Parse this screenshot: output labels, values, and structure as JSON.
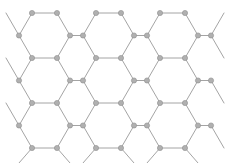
{
  "figure": {
    "background_color": "#ffffff",
    "node_color": "#b0b0b0",
    "node_stroke_color": "#8e8e8e",
    "bond_color": "#9a9a9a",
    "node_radius": 2.6,
    "bond_width": 0.9,
    "width": 239,
    "height": 163
  },
  "chart_data": {
    "type": "scatter",
    "title": "",
    "xlabel": "",
    "ylabel": "",
    "grid": false,
    "legend": null,
    "xlim": [
      0,
      239
    ],
    "ylim": [
      0,
      163
    ],
    "lattice": {
      "kind": "honeycomb",
      "rows": 4,
      "cols": 6,
      "hex_circumradius": 25.7,
      "hex_apothem": 22.3,
      "origin_x": 19.0,
      "origin_y": 13.0,
      "column_step_x": 38.6,
      "row_step_y": 44.6,
      "sublattice_offset_y": 22.3
    },
    "nodes": [
      [
        32.0,
        13.0
      ],
      [
        57.0,
        13.0
      ],
      [
        96.0,
        13.0
      ],
      [
        121.0,
        13.0
      ],
      [
        160.0,
        13.0
      ],
      [
        185.0,
        13.0
      ],
      [
        19.0,
        35.5
      ],
      [
        70.0,
        35.5
      ],
      [
        83.0,
        35.5
      ],
      [
        134.0,
        35.5
      ],
      [
        147.0,
        35.5
      ],
      [
        198.0,
        35.5
      ],
      [
        211.0,
        35.5
      ],
      [
        32.0,
        58.0
      ],
      [
        57.0,
        58.0
      ],
      [
        96.0,
        58.0
      ],
      [
        121.0,
        58.0
      ],
      [
        160.0,
        58.0
      ],
      [
        185.0,
        58.0
      ],
      [
        19.0,
        80.5
      ],
      [
        70.0,
        80.5
      ],
      [
        83.0,
        80.5
      ],
      [
        134.0,
        80.5
      ],
      [
        147.0,
        80.5
      ],
      [
        198.0,
        80.5
      ],
      [
        211.0,
        80.5
      ],
      [
        32.0,
        103.0
      ],
      [
        57.0,
        103.0
      ],
      [
        96.0,
        103.0
      ],
      [
        121.0,
        103.0
      ],
      [
        160.0,
        103.0
      ],
      [
        185.0,
        103.0
      ],
      [
        19.0,
        125.5
      ],
      [
        70.0,
        125.5
      ],
      [
        83.0,
        125.5
      ],
      [
        134.0,
        125.5
      ],
      [
        147.0,
        125.5
      ],
      [
        198.0,
        125.5
      ],
      [
        211.0,
        125.5
      ],
      [
        32.0,
        148.0
      ],
      [
        57.0,
        148.0
      ],
      [
        96.0,
        148.0
      ],
      [
        121.0,
        148.0
      ],
      [
        160.0,
        148.0
      ],
      [
        185.0,
        148.0
      ]
    ],
    "bonds": [
      [
        32.0,
        13.0,
        57.0,
        13.0
      ],
      [
        96.0,
        13.0,
        121.0,
        13.0
      ],
      [
        160.0,
        13.0,
        185.0,
        13.0
      ],
      [
        32.0,
        13.0,
        19.0,
        35.5
      ],
      [
        57.0,
        13.0,
        70.0,
        35.5
      ],
      [
        96.0,
        13.0,
        83.0,
        35.5
      ],
      [
        121.0,
        13.0,
        134.0,
        35.5
      ],
      [
        160.0,
        13.0,
        147.0,
        35.5
      ],
      [
        185.0,
        13.0,
        198.0,
        35.5
      ],
      [
        70.0,
        35.5,
        83.0,
        35.5
      ],
      [
        134.0,
        35.5,
        147.0,
        35.5
      ],
      [
        198.0,
        35.5,
        211.0,
        35.5
      ],
      [
        19.0,
        35.5,
        32.0,
        58.0
      ],
      [
        70.0,
        35.5,
        57.0,
        58.0
      ],
      [
        83.0,
        35.5,
        96.0,
        58.0
      ],
      [
        134.0,
        35.5,
        121.0,
        58.0
      ],
      [
        147.0,
        35.5,
        160.0,
        58.0
      ],
      [
        198.0,
        35.5,
        185.0,
        58.0
      ],
      [
        211.0,
        35.5,
        224.0,
        58.0
      ],
      [
        32.0,
        58.0,
        57.0,
        58.0
      ],
      [
        96.0,
        58.0,
        121.0,
        58.0
      ],
      [
        160.0,
        58.0,
        185.0,
        58.0
      ],
      [
        32.0,
        58.0,
        19.0,
        80.5
      ],
      [
        57.0,
        58.0,
        70.0,
        80.5
      ],
      [
        96.0,
        58.0,
        83.0,
        80.5
      ],
      [
        121.0,
        58.0,
        134.0,
        80.5
      ],
      [
        160.0,
        58.0,
        147.0,
        80.5
      ],
      [
        185.0,
        58.0,
        198.0,
        80.5
      ],
      [
        70.0,
        80.5,
        83.0,
        80.5
      ],
      [
        134.0,
        80.5,
        147.0,
        80.5
      ],
      [
        198.0,
        80.5,
        211.0,
        80.5
      ],
      [
        19.0,
        80.5,
        32.0,
        103.0
      ],
      [
        70.0,
        80.5,
        57.0,
        103.0
      ],
      [
        83.0,
        80.5,
        96.0,
        103.0
      ],
      [
        134.0,
        80.5,
        121.0,
        103.0
      ],
      [
        147.0,
        80.5,
        160.0,
        103.0
      ],
      [
        198.0,
        80.5,
        185.0,
        103.0
      ],
      [
        211.0,
        80.5,
        224.0,
        103.0
      ],
      [
        32.0,
        103.0,
        57.0,
        103.0
      ],
      [
        96.0,
        103.0,
        121.0,
        103.0
      ],
      [
        160.0,
        103.0,
        185.0,
        103.0
      ],
      [
        32.0,
        103.0,
        19.0,
        125.5
      ],
      [
        57.0,
        103.0,
        70.0,
        125.5
      ],
      [
        96.0,
        103.0,
        83.0,
        125.5
      ],
      [
        121.0,
        103.0,
        134.0,
        125.5
      ],
      [
        160.0,
        103.0,
        147.0,
        125.5
      ],
      [
        185.0,
        103.0,
        198.0,
        125.5
      ],
      [
        70.0,
        125.5,
        83.0,
        125.5
      ],
      [
        134.0,
        125.5,
        147.0,
        125.5
      ],
      [
        198.0,
        125.5,
        211.0,
        125.5
      ],
      [
        19.0,
        125.5,
        32.0,
        148.0
      ],
      [
        70.0,
        125.5,
        57.0,
        148.0
      ],
      [
        83.0,
        125.5,
        96.0,
        148.0
      ],
      [
        134.0,
        125.5,
        121.0,
        148.0
      ],
      [
        147.0,
        125.5,
        160.0,
        148.0
      ],
      [
        198.0,
        125.5,
        185.0,
        148.0
      ],
      [
        211.0,
        125.5,
        224.0,
        148.0
      ],
      [
        32.0,
        148.0,
        57.0,
        148.0
      ],
      [
        96.0,
        148.0,
        121.0,
        148.0
      ],
      [
        160.0,
        148.0,
        185.0,
        148.0
      ],
      [
        32.0,
        148.0,
        19.0,
        163.0
      ],
      [
        57.0,
        148.0,
        70.0,
        163.0
      ],
      [
        96.0,
        148.0,
        83.0,
        163.0
      ],
      [
        121.0,
        148.0,
        134.0,
        163.0
      ],
      [
        160.0,
        148.0,
        147.0,
        163.0
      ],
      [
        185.0,
        148.0,
        198.0,
        163.0
      ],
      [
        19.0,
        35.5,
        6.0,
        13.0
      ],
      [
        211.0,
        35.5,
        224.0,
        13.0
      ],
      [
        19.0,
        80.5,
        6.0,
        58.0
      ],
      [
        19.0,
        125.5,
        6.0,
        103.0
      ]
    ]
  }
}
